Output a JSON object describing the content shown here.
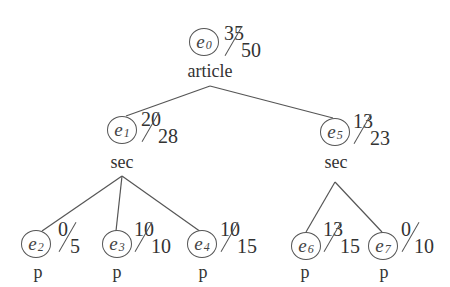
{
  "diagram": {
    "type": "tree",
    "nodes": [
      {
        "id": "e0",
        "symbol": "e",
        "subscript": "0",
        "label": "article",
        "num": "35",
        "den": "50",
        "level": 0
      },
      {
        "id": "e1",
        "symbol": "e",
        "subscript": "1",
        "label": "sec",
        "num": "20",
        "den": "28",
        "level": 1,
        "parent": "e0"
      },
      {
        "id": "e5",
        "symbol": "e",
        "subscript": "5",
        "label": "sec",
        "num": "13",
        "den": "23",
        "level": 1,
        "parent": "e0"
      },
      {
        "id": "e2",
        "symbol": "e",
        "subscript": "2",
        "label": "p",
        "num": "0",
        "den": "5",
        "level": 2,
        "parent": "e1"
      },
      {
        "id": "e3",
        "symbol": "e",
        "subscript": "3",
        "label": "p",
        "num": "10",
        "den": "10",
        "level": 2,
        "parent": "e1"
      },
      {
        "id": "e4",
        "symbol": "e",
        "subscript": "4",
        "label": "p",
        "num": "10",
        "den": "15",
        "level": 2,
        "parent": "e1"
      },
      {
        "id": "e6",
        "symbol": "e",
        "subscript": "6",
        "label": "p",
        "num": "13",
        "den": "15",
        "level": 2,
        "parent": "e5"
      },
      {
        "id": "e7",
        "symbol": "e",
        "subscript": "7",
        "label": "p",
        "num": "0",
        "den": "10",
        "level": 2,
        "parent": "e5"
      }
    ],
    "edges": [
      [
        "e0",
        "e1"
      ],
      [
        "e0",
        "e5"
      ],
      [
        "e1",
        "e2"
      ],
      [
        "e1",
        "e3"
      ],
      [
        "e1",
        "e4"
      ],
      [
        "e5",
        "e6"
      ],
      [
        "e5",
        "e7"
      ]
    ],
    "colors": {
      "line": "#555555",
      "text": "#333333",
      "background": "#ffffff"
    }
  }
}
